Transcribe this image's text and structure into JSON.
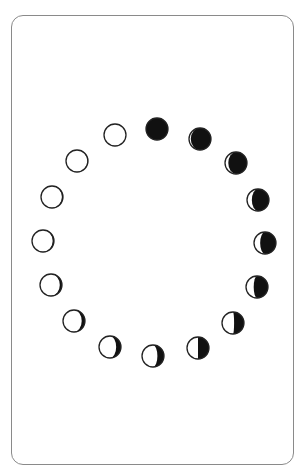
{
  "card": {
    "border_color": "#8a8a8a",
    "background": "#ffffff"
  },
  "moon_style": {
    "dark_color": "#111111",
    "light_color": "#ffffff",
    "outline_color": "#222222",
    "radius": 11
  },
  "moon_phases": [
    {
      "name": "full-moon",
      "cx": 115,
      "cy": 135,
      "dark_fraction": 0.0,
      "dark_side": "right"
    },
    {
      "name": "new-moon",
      "cx": 157,
      "cy": 129,
      "dark_fraction": 1.0,
      "dark_side": "right"
    },
    {
      "name": "waxing-crescent-thin",
      "cx": 200,
      "cy": 139,
      "dark_fraction": 0.92,
      "dark_side": "right"
    },
    {
      "name": "waxing-crescent",
      "cx": 236,
      "cy": 163,
      "dark_fraction": 0.85,
      "dark_side": "right"
    },
    {
      "name": "waxing-crescent-2",
      "cx": 258,
      "cy": 200,
      "dark_fraction": 0.78,
      "dark_side": "right"
    },
    {
      "name": "waxing-crescent-3",
      "cx": 265,
      "cy": 243,
      "dark_fraction": 0.72,
      "dark_side": "right"
    },
    {
      "name": "waxing-crescent-4",
      "cx": 257,
      "cy": 287,
      "dark_fraction": 0.65,
      "dark_side": "right"
    },
    {
      "name": "near-quarter",
      "cx": 233,
      "cy": 323,
      "dark_fraction": 0.45,
      "dark_side": "right"
    },
    {
      "name": "first-quarter",
      "cx": 198,
      "cy": 348,
      "dark_fraction": 0.5,
      "dark_side": "right"
    },
    {
      "name": "waxing-gibbous",
      "cx": 153,
      "cy": 356,
      "dark_fraction": 0.3,
      "dark_side": "right"
    },
    {
      "name": "waxing-gibbous-2",
      "cx": 110,
      "cy": 347,
      "dark_fraction": 0.22,
      "dark_side": "right"
    },
    {
      "name": "waxing-gibbous-3",
      "cx": 74,
      "cy": 321,
      "dark_fraction": 0.15,
      "dark_side": "right"
    },
    {
      "name": "near-full",
      "cx": 51,
      "cy": 285,
      "dark_fraction": 0.1,
      "dark_side": "right"
    },
    {
      "name": "near-full-2",
      "cx": 43,
      "cy": 241,
      "dark_fraction": 0.06,
      "dark_side": "right"
    },
    {
      "name": "near-full-3",
      "cx": 52,
      "cy": 197,
      "dark_fraction": 0.05,
      "dark_side": "right"
    },
    {
      "name": "near-full-4",
      "cx": 77,
      "cy": 161,
      "dark_fraction": 0.03,
      "dark_side": "right"
    }
  ]
}
